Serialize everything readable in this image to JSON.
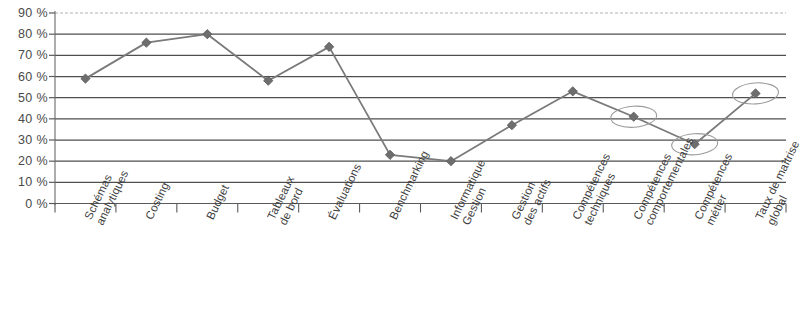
{
  "chart_data": {
    "type": "line",
    "title": "",
    "subtitle": "",
    "xlabel": "",
    "ylabel": "",
    "ylim": [
      0,
      90
    ],
    "ytick_step": 10,
    "ytick_labels": [
      "0 %",
      "10 %",
      "20 %",
      "30 %",
      "40 %",
      "50 %",
      "60 %",
      "70 %",
      "80 %",
      "90 %"
    ],
    "ytick_values": [
      0,
      10,
      20,
      30,
      40,
      50,
      60,
      70,
      80,
      90
    ],
    "grid": true,
    "grid_orientation": "horizontal",
    "legend": "none",
    "categories": [
      "Schémas analytiques",
      "Costing",
      "Budget",
      "Tableaux de bord",
      "Évaluations",
      "Benchmarking",
      "Informatique Gestion",
      "Gestion des actifs",
      "Compétences techniques",
      "Compétences comportementales",
      "Compétences métier",
      "Taux de maîtrise global"
    ],
    "category_lines": [
      [
        "Schémas",
        "analytiques"
      ],
      [
        "Costing",
        ""
      ],
      [
        "Budget",
        ""
      ],
      [
        "Tableaux",
        "de bord"
      ],
      [
        "Évaluations",
        ""
      ],
      [
        "Benchmarking",
        ""
      ],
      [
        "Informatique",
        "Gestion"
      ],
      [
        "Gestion",
        "des actifs"
      ],
      [
        "Compétences",
        "techniques"
      ],
      [
        "Compétences",
        "comportementales"
      ],
      [
        "Compétences",
        "métier"
      ],
      [
        "Taux de maîtrise",
        "global"
      ]
    ],
    "series": [
      {
        "name": "Taux de maîtrise",
        "values": [
          59,
          76,
          80,
          58,
          74,
          23,
          20,
          37,
          53,
          41,
          28,
          52
        ]
      }
    ],
    "annotations": [
      {
        "type": "ellipse",
        "category": "Compétences comportementales",
        "value": 41
      },
      {
        "type": "ellipse",
        "category": "Compétences métier",
        "value": 28
      },
      {
        "type": "ellipse",
        "category": "Taux de maîtrise global",
        "value": 52
      }
    ],
    "colors": {
      "line": "#7a7a7a",
      "marker": "#6e6e6e",
      "grid": "#4f4f4f",
      "axis": "#5a5a5a",
      "annotation": "#9b9b9b",
      "text": "#3f3f3f"
    }
  }
}
